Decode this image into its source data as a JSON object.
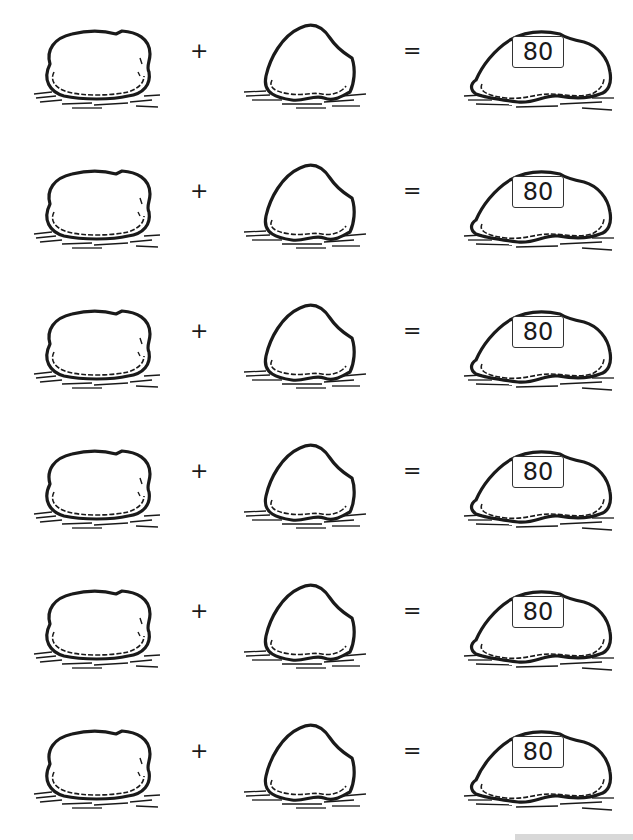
{
  "worksheet": {
    "operator_plus": "+",
    "operator_equals": "=",
    "rows": [
      {
        "addend1": "",
        "addend2": "",
        "sum": "80"
      },
      {
        "addend1": "",
        "addend2": "",
        "sum": "80"
      },
      {
        "addend1": "",
        "addend2": "",
        "sum": "80"
      },
      {
        "addend1": "",
        "addend2": "",
        "sum": "80"
      },
      {
        "addend1": "",
        "addend2": "",
        "sum": "80"
      },
      {
        "addend1": "",
        "addend2": "",
        "sum": "80"
      }
    ]
  },
  "colors": {
    "ink": "#1a1a1a",
    "paper": "#ffffff",
    "box_border": "#333333"
  }
}
